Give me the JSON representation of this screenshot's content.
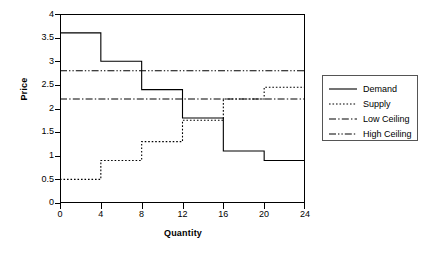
{
  "chart_data": {
    "type": "line",
    "title": "",
    "xlabel": "Quantity",
    "ylabel": "Price",
    "xlim": [
      0,
      24
    ],
    "ylim": [
      0,
      4
    ],
    "grid": false,
    "legend_position": "right",
    "x_ticks": [
      "0",
      "4",
      "8",
      "12",
      "16",
      "20",
      "24"
    ],
    "y_ticks": [
      "0",
      "0.5",
      "1",
      "1.5",
      "2",
      "2.5",
      "3",
      "3.5",
      "4"
    ],
    "step_edges": [
      0,
      4,
      8,
      12,
      16,
      20,
      24
    ],
    "series": [
      {
        "name": "Demand",
        "style": "solid",
        "kind": "step",
        "values": [
          3.6,
          3.0,
          2.4,
          1.8,
          1.1,
          0.9
        ]
      },
      {
        "name": "Supply",
        "style": "dotted",
        "kind": "step",
        "values": [
          0.5,
          0.9,
          1.3,
          1.75,
          2.2,
          2.45
        ]
      },
      {
        "name": "Low Ceiling",
        "style": "dash-dot",
        "kind": "hline",
        "value": 2.2
      },
      {
        "name": "High Ceiling",
        "style": "dash-dot-dot",
        "kind": "hline",
        "value": 2.8
      }
    ]
  },
  "axes": {
    "y_title": "Price",
    "x_title": "Quantity"
  },
  "legend": {
    "items": [
      {
        "label": "Demand"
      },
      {
        "label": "Supply"
      },
      {
        "label": "Low Ceiling"
      },
      {
        "label": "High Ceiling"
      }
    ]
  },
  "colors": {
    "line": "#000000",
    "frame": "#000000",
    "legend_border": "#555555",
    "background": "#ffffff"
  }
}
